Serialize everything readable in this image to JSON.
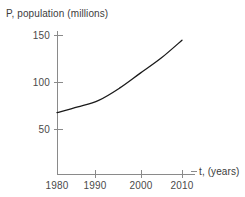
{
  "chart_data": {
    "type": "line",
    "title": "",
    "xlabel": "t, (years)",
    "ylabel": "P, population (millions)",
    "x": [
      1980,
      1985,
      1990,
      1995,
      2000,
      2005,
      2010
    ],
    "values": [
      68,
      74,
      81,
      94,
      110,
      126,
      145
    ],
    "series": [
      {
        "name": "population",
        "values": [
          68,
          74,
          81,
          94,
          110,
          126,
          145
        ]
      }
    ],
    "xticks": [
      1980,
      1990,
      2000,
      2010
    ],
    "xtick_labels": [
      "1980",
      "1990",
      "2000",
      "2010"
    ],
    "yticks": [
      50,
      100,
      150
    ],
    "ytick_labels": [
      "50",
      "100",
      "150"
    ],
    "xlim": [
      1980,
      2012
    ],
    "ylim": [
      0,
      160
    ],
    "grid": false,
    "legend": false,
    "line_color": "#1a1a1a",
    "axis_color": "#8a8a8a",
    "background": "#ffffff"
  },
  "axes": {
    "y_title": "P, population (millions)",
    "x_title": "t, (years)"
  }
}
